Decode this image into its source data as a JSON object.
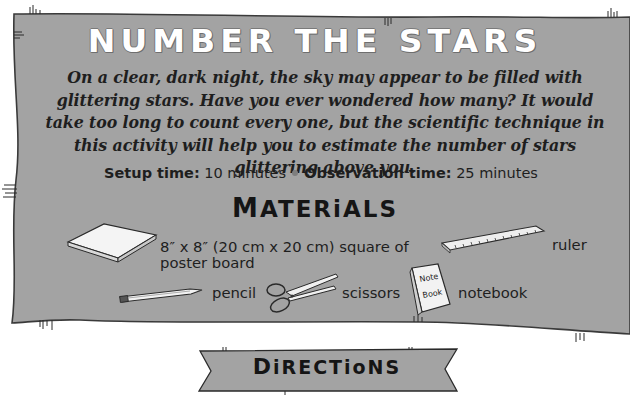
{
  "title": "NUMBER THE STARS",
  "intro": "On a clear, dark night, the sky may appear to be filled with glittering stars. Have you ever wondered how many? It would take too long to count every one, but the scientific technique in this activity will help you to estimate the number of stars glittering above you.",
  "times": {
    "setup_label": "Setup time:",
    "setup_value": "10 minutes",
    "observation_label": "Observation time:",
    "observation_value": "25 minutes"
  },
  "materials": {
    "heading_first": "M",
    "heading_rest": "ATERiALS",
    "items": [
      {
        "icon": "poster-board-icon",
        "label_line1": "8″ x 8″ (20 cm x 20 cm) square of",
        "label_line2": "poster board"
      },
      {
        "icon": "ruler-icon",
        "label": "ruler"
      },
      {
        "icon": "pencil-icon",
        "label": "pencil"
      },
      {
        "icon": "scissors-icon",
        "label": "scissors"
      },
      {
        "icon": "notebook-icon",
        "label": "notebook",
        "icon_text_1": "Note",
        "icon_text_2": "Book"
      }
    ]
  },
  "directions": {
    "first": "D",
    "rest": "iRECTioNS"
  },
  "colors": {
    "panel": "#a3a3a3",
    "panel_edge": "#3a3a3a",
    "text": "#1e1e1e",
    "title": "#ffffff"
  }
}
